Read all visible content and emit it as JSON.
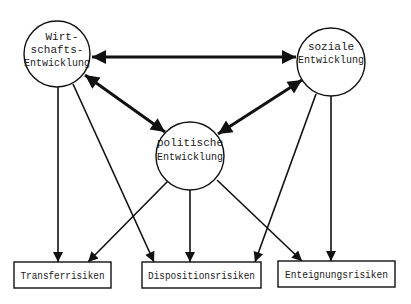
{
  "diagram": {
    "type": "influence diagram",
    "colors": {
      "background": "#ffffff",
      "stroke": "#111111",
      "text": "#1a1a1a"
    },
    "nodes": {
      "wirtschaft": {
        "shape": "circle",
        "lines": [
          "Wirt-",
          "schafts-",
          "Entwicklung"
        ]
      },
      "sozial": {
        "shape": "circle",
        "lines": [
          "soziale",
          "Entwicklung"
        ]
      },
      "politisch": {
        "shape": "circle",
        "lines": [
          "politische",
          "Entwicklung"
        ]
      },
      "transfer": {
        "shape": "rectangle",
        "label": "Transferrisiken"
      },
      "disposition": {
        "shape": "rectangle",
        "label": "Dispositionsrisiken"
      },
      "enteignung": {
        "shape": "rectangle",
        "label": "Enteignungsrisiken"
      }
    },
    "edges": [
      {
        "from": "wirtschaft",
        "to": "sozial",
        "direction": "both",
        "weight": "thick"
      },
      {
        "from": "wirtschaft",
        "to": "politisch",
        "direction": "both",
        "weight": "thick"
      },
      {
        "from": "sozial",
        "to": "politisch",
        "direction": "both",
        "weight": "thick"
      },
      {
        "from": "wirtschaft",
        "to": "transfer",
        "direction": "forward",
        "weight": "thin"
      },
      {
        "from": "wirtschaft",
        "to": "disposition",
        "direction": "forward",
        "weight": "thin"
      },
      {
        "from": "politisch",
        "to": "transfer",
        "direction": "forward",
        "weight": "thin"
      },
      {
        "from": "politisch",
        "to": "disposition",
        "direction": "forward",
        "weight": "thin"
      },
      {
        "from": "politisch",
        "to": "enteignung",
        "direction": "forward",
        "weight": "thin"
      },
      {
        "from": "sozial",
        "to": "disposition",
        "direction": "forward",
        "weight": "thin"
      },
      {
        "from": "sozial",
        "to": "enteignung",
        "direction": "forward",
        "weight": "thin"
      }
    ]
  }
}
